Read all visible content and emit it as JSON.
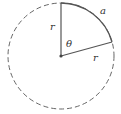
{
  "diagram": {
    "type": "circle-sector",
    "labels": {
      "arc": "a",
      "radius_vertical": "r",
      "radius_slanted": "r",
      "angle": "θ"
    },
    "colors": {
      "stroke": "#555555",
      "dashed_circle": "#666666",
      "center_dot": "#444444",
      "text": "#333333"
    }
  }
}
